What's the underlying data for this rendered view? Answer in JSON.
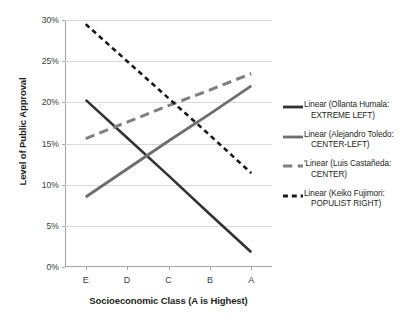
{
  "chart_data": {
    "type": "line",
    "title": "",
    "xlabel": "Socioeconomic Class (A is Highest)",
    "ylabel": "Level of Public Approval",
    "categories": [
      "E",
      "D",
      "C",
      "B",
      "A"
    ],
    "x_tick_labels": [
      "E",
      "D",
      "C",
      "B",
      "A"
    ],
    "y_tick_labels": [
      "0%",
      "5%",
      "10%",
      "15%",
      "20%",
      "25%",
      "30%"
    ],
    "y_tick_values": [
      0,
      5,
      10,
      15,
      20,
      25,
      30
    ],
    "ylim": [
      0,
      30
    ],
    "grid": "horizontal",
    "legend_position": "right",
    "series": [
      {
        "name": "Linear (Ollanta Humala: EXTREME LEFT)",
        "legend_line1": "Linear (Ollanta Humala:",
        "legend_line2": "EXTREME LEFT)",
        "style": "solid",
        "color": "#333333",
        "width": 2.6,
        "values": [
          20.3,
          15.7,
          11.1,
          6.4,
          1.8
        ]
      },
      {
        "name": "Linear (Alejandro Toledo: CENTER-LEFT)",
        "legend_line1": "Linear (Alejandro Toledo:",
        "legend_line2": "CENTER-LEFT)",
        "style": "solid",
        "color": "#6e6e6e",
        "width": 2.8,
        "values": [
          8.5,
          11.9,
          15.3,
          18.6,
          22.0
        ]
      },
      {
        "name": "Linear (Luis Castañeda: CENTER)",
        "legend_line1": "Linear (Luis Castañeda:",
        "legend_line2": "CENTER)",
        "legend_prefix": "'",
        "style": "long-dash",
        "color": "#808080",
        "width": 3.0,
        "values": [
          15.6,
          17.6,
          19.6,
          21.5,
          23.5
        ]
      },
      {
        "name": "Linear (Keiko Fujimori: POPULIST RIGHT)",
        "legend_line1": "Linear (Keiko Fujimori:",
        "legend_line2": "POPULIST RIGHT)",
        "style": "dash",
        "color": "#1a1a1a",
        "width": 2.6,
        "values": [
          29.5,
          25.0,
          20.5,
          16.0,
          11.4
        ]
      }
    ]
  },
  "axes": {
    "y_title": "Level of Public Approval",
    "x_title": "Socioeconomic Class (A is Highest)"
  },
  "colors": {
    "gridline": "#d9d9d9",
    "axis": "#a6a6a6",
    "text": "#231f20",
    "background": "#ffffff"
  }
}
